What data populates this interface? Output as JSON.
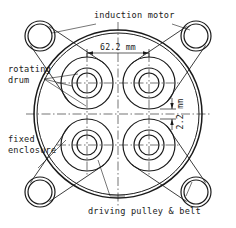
{
  "drawing": {
    "title": "rotary drum assembly plan view",
    "background_color": "#ffffff",
    "line_color": "#1a1a1a",
    "center_line_color": "#1a1a1a"
  },
  "labels": {
    "induction_motor": "induction motor",
    "rotating_drum_line1": "rotating",
    "rotating_drum_line2": "drum",
    "fixed_enclosure_line1": "fixed",
    "fixed_enclosure_line2": "enclosure",
    "driving_pulley_belt": "driving pulley & belt"
  },
  "dimensions": {
    "horizontal": {
      "value": "62.2 mm",
      "number": 62.2,
      "unit": "mm",
      "orientation": "horizontal",
      "description": "drum center-to-center spacing"
    },
    "vertical": {
      "value": "2.2 mm",
      "number": 2.2,
      "unit": "mm",
      "orientation": "vertical-rotated",
      "description": "gap between adjacent drum outer edges"
    }
  },
  "geometry": {
    "enclosure": {
      "cx": 118,
      "cy": 114,
      "r_outer": 84,
      "r_inner": 81
    },
    "drums": [
      {
        "id": "drum-top-left",
        "cx": 87,
        "cy": 83,
        "r_outer": 26,
        "r_mid": 15,
        "r_inner": 10
      },
      {
        "id": "drum-top-right",
        "cx": 149,
        "cy": 83,
        "r_outer": 26,
        "r_mid": 15,
        "r_inner": 10
      },
      {
        "id": "drum-bottom-left",
        "cx": 87,
        "cy": 145,
        "r_outer": 26,
        "r_mid": 15,
        "r_inner": 10
      },
      {
        "id": "drum-bottom-right",
        "cx": 149,
        "cy": 145,
        "r_outer": 26,
        "r_mid": 15,
        "r_inner": 10
      }
    ],
    "motors": [
      {
        "id": "motor-top-left",
        "cx": 40,
        "cy": 36,
        "r_outer": 15,
        "r_inner": 12
      },
      {
        "id": "motor-top-right",
        "cx": 196,
        "cy": 36,
        "r_outer": 15,
        "r_inner": 12
      },
      {
        "id": "motor-bottom-left",
        "cx": 40,
        "cy": 192,
        "r_outer": 15,
        "r_inner": 12
      },
      {
        "id": "motor-bottom-right",
        "cx": 196,
        "cy": 192,
        "r_outer": 15,
        "r_inner": 12
      }
    ]
  }
}
